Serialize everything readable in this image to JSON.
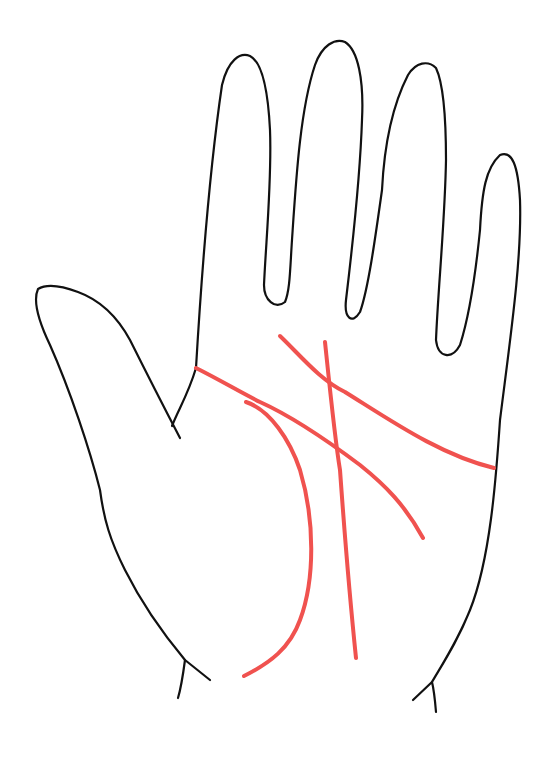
{
  "figure": {
    "outline_color": "#111111",
    "line_color": "#f0524f",
    "background": "#ffffff",
    "palm_lines": [
      {
        "name": "heart-line"
      },
      {
        "name": "head-line"
      },
      {
        "name": "life-line"
      },
      {
        "name": "fate-line"
      },
      {
        "name": "cross-line"
      }
    ]
  }
}
